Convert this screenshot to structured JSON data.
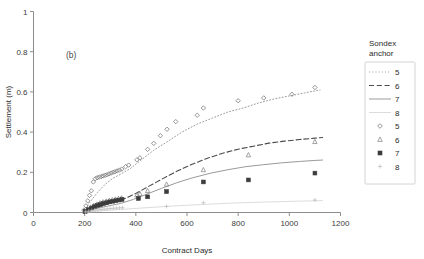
{
  "chart_data": {
    "type": "scatter",
    "title": "",
    "panel_label": "(b)",
    "xlabel": "Contract Days",
    "ylabel": "Settlement (m)",
    "xlim": [
      0,
      1200
    ],
    "ylim": [
      0,
      1
    ],
    "xticks": [
      0,
      200,
      400,
      600,
      800,
      1000,
      1200
    ],
    "yticks": [
      0,
      0.2,
      0.4,
      0.6,
      0.8,
      1
    ],
    "xticklabels": [
      "0",
      "200",
      "400",
      "600",
      "800",
      "1000",
      "1200"
    ],
    "yticklabels": [
      "0",
      "0.2",
      "0.4",
      "0.6",
      "0.8",
      "1"
    ],
    "grid": false,
    "legend_position": "right",
    "legend_title_lines": [
      "Sondex",
      "anchor"
    ],
    "series": [
      {
        "name": "5",
        "kind": "line",
        "style": "dotted",
        "color": "#9a9a9a",
        "legend_label": "5",
        "x": [
          195,
          220,
          250,
          280,
          310,
          340,
          380,
          420,
          470,
          520,
          580,
          640,
          700,
          760,
          820,
          880,
          940,
          1000,
          1060,
          1120
        ],
        "y": [
          0.01,
          0.05,
          0.1,
          0.14,
          0.17,
          0.19,
          0.22,
          0.26,
          0.31,
          0.35,
          0.4,
          0.44,
          0.47,
          0.5,
          0.52,
          0.545,
          0.565,
          0.58,
          0.595,
          0.61
        ]
      },
      {
        "name": "6",
        "kind": "line",
        "style": "dashed",
        "color": "#4a4a4a",
        "legend_label": "6",
        "x": [
          195,
          230,
          270,
          310,
          350,
          400,
          450,
          500,
          560,
          620,
          680,
          740,
          800,
          860,
          920,
          980,
          1040,
          1100,
          1130
        ],
        "y": [
          0.005,
          0.02,
          0.035,
          0.05,
          0.065,
          0.095,
          0.13,
          0.165,
          0.205,
          0.24,
          0.27,
          0.295,
          0.315,
          0.33,
          0.345,
          0.355,
          0.363,
          0.37,
          0.373
        ]
      },
      {
        "name": "7",
        "kind": "line",
        "style": "solid",
        "color": "#9a9a9a",
        "legend_label": "7",
        "x": [
          195,
          240,
          290,
          340,
          390,
          440,
          500,
          560,
          620,
          690,
          760,
          830,
          900,
          970,
          1040,
          1100,
          1130
        ],
        "y": [
          0.004,
          0.018,
          0.032,
          0.045,
          0.065,
          0.09,
          0.12,
          0.148,
          0.172,
          0.195,
          0.213,
          0.228,
          0.238,
          0.247,
          0.254,
          0.259,
          0.261
        ]
      },
      {
        "name": "8",
        "kind": "line",
        "style": "faint",
        "color": "#d8d8d8",
        "legend_label": "8",
        "x": [
          195,
          300,
          420,
          540,
          660,
          780,
          900,
          1020,
          1130
        ],
        "y": [
          0.002,
          0.012,
          0.022,
          0.032,
          0.04,
          0.047,
          0.052,
          0.056,
          0.059
        ]
      },
      {
        "name": "5",
        "kind": "marker",
        "marker": "diamond",
        "color": "#7a7a7a",
        "legend_label": "5",
        "x": [
          197,
          205,
          212,
          219,
          226,
          234,
          241,
          249,
          257,
          265,
          272,
          280,
          287,
          295,
          303,
          311,
          319,
          327,
          336,
          345,
          360,
          372,
          404,
          416,
          446,
          470,
          496,
          522,
          556,
          640,
          664,
          800,
          900,
          1010,
          1100
        ],
        "y": [
          0.012,
          0.033,
          0.058,
          0.085,
          0.108,
          0.152,
          0.168,
          0.173,
          0.176,
          0.179,
          0.182,
          0.185,
          0.188,
          0.192,
          0.196,
          0.2,
          0.203,
          0.207,
          0.211,
          0.216,
          0.228,
          0.236,
          0.262,
          0.272,
          0.314,
          0.344,
          0.382,
          0.414,
          0.452,
          0.484,
          0.52,
          0.556,
          0.57,
          0.588,
          0.622
        ]
      },
      {
        "name": "6",
        "kind": "marker",
        "marker": "triangle",
        "color": "#8a8a8a",
        "legend_label": "6",
        "x": [
          200,
          212,
          224,
          236,
          248,
          260,
          272,
          284,
          296,
          308,
          320,
          332,
          344,
          404,
          416,
          446,
          520,
          664,
          840,
          1100
        ],
        "y": [
          0.006,
          0.016,
          0.026,
          0.034,
          0.041,
          0.047,
          0.052,
          0.056,
          0.06,
          0.063,
          0.066,
          0.069,
          0.072,
          0.086,
          0.092,
          0.108,
          0.14,
          0.212,
          0.286,
          0.352
        ]
      },
      {
        "name": "7",
        "kind": "marker",
        "marker": "square",
        "color": "#3c3c3c",
        "legend_label": "7",
        "x": [
          202,
          214,
          226,
          238,
          250,
          262,
          274,
          286,
          298,
          310,
          322,
          334,
          346,
          410,
          446,
          520,
          664,
          840,
          1100
        ],
        "y": [
          0.005,
          0.014,
          0.022,
          0.029,
          0.035,
          0.04,
          0.045,
          0.049,
          0.053,
          0.056,
          0.059,
          0.062,
          0.065,
          0.07,
          0.078,
          0.104,
          0.152,
          0.162,
          0.196
        ]
      },
      {
        "name": "8",
        "kind": "marker",
        "marker": "plus",
        "color": "#c0c0c0",
        "legend_label": "8",
        "x": [
          204,
          216,
          228,
          240,
          252,
          264,
          276,
          288,
          300,
          312,
          324,
          336,
          348,
          520,
          664,
          1100
        ],
        "y": [
          0.003,
          0.006,
          0.009,
          0.011,
          0.013,
          0.015,
          0.017,
          0.018,
          0.02,
          0.021,
          0.022,
          0.023,
          0.024,
          0.03,
          0.048,
          0.062
        ]
      }
    ]
  }
}
